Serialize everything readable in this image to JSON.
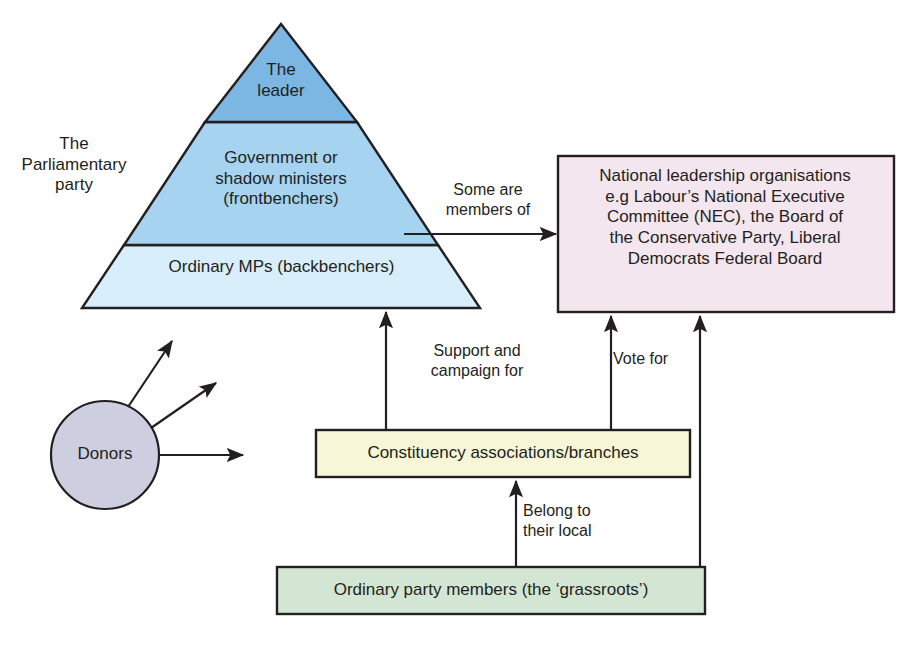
{
  "diagram": {
    "pyramid": {
      "side_label": "The\nParliamentary\nparty",
      "tiers": [
        {
          "id": "leader",
          "label": "The\nleader",
          "fill": "#7cb6e2"
        },
        {
          "id": "frontbenchers",
          "label": "Government or\nshadow ministers\n(frontbenchers)",
          "fill": "#a6d3f0"
        },
        {
          "id": "backbenchers",
          "label": "Ordinary MPs (backbenchers)",
          "fill": "#d9eefb"
        }
      ]
    },
    "nodes": {
      "donors": {
        "label": "Donors",
        "shape": "circle",
        "fill": "#cdcfe0"
      },
      "national_leadership": {
        "label": "National leadership organisations\ne.g Labour’s National Executive\nCommittee (NEC), the Board of\nthe Conservative Party, Liberal\nDemocrats Federal Board",
        "shape": "rect",
        "fill": "#f4e6ee"
      },
      "constituency": {
        "label": "Constituency associations/branches",
        "shape": "rect",
        "fill": "#f7f6d7"
      },
      "grassroots": {
        "label": "Ordinary party members (the ‘grassroots’)",
        "shape": "rect",
        "fill": "#d3e6d4"
      }
    },
    "edges": [
      {
        "id": "some-are-members-of",
        "label": "Some are\nmembers of",
        "from": "parliamentary-party",
        "to": "national_leadership"
      },
      {
        "id": "support-and-campaign-for",
        "label": "Support and\ncampaign for",
        "from": "constituency",
        "to": "parliamentary-party"
      },
      {
        "id": "vote-for",
        "label": "Vote for",
        "from": "constituency",
        "to": "national_leadership"
      },
      {
        "id": "belong-to-their-local",
        "label": "Belong to\ntheir local",
        "from": "grassroots",
        "to": "constituency"
      },
      {
        "id": "grassroots-to-national-leadership",
        "label": "",
        "from": "grassroots",
        "to": "national_leadership"
      },
      {
        "id": "donors-arrow-1",
        "label": "",
        "from": "donors",
        "to": ""
      },
      {
        "id": "donors-arrow-2",
        "label": "",
        "from": "donors",
        "to": ""
      },
      {
        "id": "donors-arrow-3",
        "label": "",
        "from": "donors",
        "to": ""
      }
    ],
    "colors": {
      "stroke": "#231f20",
      "background": "#ffffff",
      "tier_leader": "#7cb6e2",
      "tier_frontbench": "#a6d3f0",
      "tier_backbench": "#d9eefb",
      "donors_fill": "#cdcfe0",
      "national_fill": "#f4e6ee",
      "constituency_fill": "#f7f6d7",
      "grassroots_fill": "#d3e6d4"
    }
  }
}
